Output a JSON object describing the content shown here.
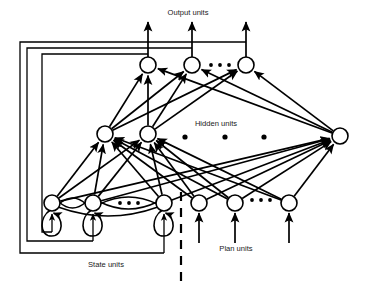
{
  "diagram": {
    "background_color": "#ffffff",
    "stroke_color": "#000000",
    "labels": {
      "output_units": "Output units",
      "hidden_units": "Hidden units",
      "state_units": "State units",
      "plan_units": "Plan units"
    },
    "layers": {
      "output": {
        "name": "Output units",
        "y": 65,
        "radius": 8,
        "nodes": [
          {
            "id": "o1",
            "x": 148,
            "y": 65
          },
          {
            "id": "o2",
            "x": 192,
            "y": 65
          },
          {
            "id": "o3",
            "x": 246,
            "y": 65
          }
        ],
        "ellipsis_dots": [
          {
            "x": 211,
            "y": 65
          },
          {
            "x": 220,
            "y": 65
          },
          {
            "x": 229,
            "y": 65
          }
        ],
        "dot_radius": 1.9
      },
      "hidden": {
        "name": "Hidden units",
        "y": 134,
        "radius": 8,
        "nodes": [
          {
            "id": "h1",
            "x": 105,
            "y": 134
          },
          {
            "id": "h2",
            "x": 148,
            "y": 134
          },
          {
            "id": "h3",
            "x": 340,
            "y": 136
          }
        ],
        "ellipsis_dots": [
          {
            "x": 185,
            "y": 137
          },
          {
            "x": 225,
            "y": 137
          },
          {
            "x": 264,
            "y": 137
          }
        ],
        "dot_radius": 2.6
      },
      "state": {
        "name": "State units",
        "y": 203,
        "radius": 8,
        "nodes": [
          {
            "id": "s1",
            "x": 52,
            "y": 203
          },
          {
            "id": "s2",
            "x": 93,
            "y": 203
          },
          {
            "id": "s3",
            "x": 164,
            "y": 203
          }
        ],
        "ellipsis_dots": [
          {
            "x": 120,
            "y": 203
          },
          {
            "x": 129,
            "y": 203
          },
          {
            "x": 138,
            "y": 203
          }
        ],
        "dot_radius": 1.9
      },
      "plan": {
        "name": "Plan units",
        "y": 203,
        "radius": 8,
        "nodes": [
          {
            "id": "p1",
            "x": 199,
            "y": 203
          },
          {
            "id": "p2",
            "x": 235,
            "y": 203
          },
          {
            "id": "p3",
            "x": 289,
            "y": 203
          }
        ],
        "ellipsis_dots": [
          {
            "x": 252,
            "y": 200
          },
          {
            "x": 261,
            "y": 200
          },
          {
            "x": 270,
            "y": 200
          }
        ],
        "dot_radius": 1.9
      }
    },
    "label_positions": {
      "output_units": {
        "x": 188,
        "y": 13
      },
      "hidden_units": {
        "x": 216,
        "y": 124
      },
      "state_units": {
        "x": 106,
        "y": 265
      },
      "plan_units": {
        "x": 236,
        "y": 249
      }
    },
    "divider": {
      "x": 181,
      "y1": 192,
      "y2": 284
    },
    "output_arrow_top_y": 22,
    "input_arrow_bottom_y": 243,
    "feedback_loops": [
      {
        "tap_x": 246,
        "top_y": 42,
        "left_x": 20,
        "bottom_y": 253,
        "target_x": 164
      },
      {
        "tap_x": 192,
        "top_y": 48,
        "left_x": 27,
        "bottom_y": 241,
        "target_x": 93
      },
      {
        "tap_x": 148,
        "top_y": 54,
        "left_x": 42,
        "bottom_y": 232,
        "target_x": 52
      }
    ]
  }
}
